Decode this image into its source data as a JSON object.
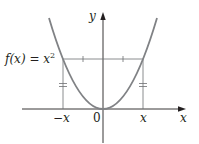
{
  "figure": {
    "function_label": "f(x) = x²",
    "function_label_base": "f(x) = x",
    "function_label_exp": "2",
    "y_axis_label": "y",
    "x_axis_label": "x",
    "tick_neg_x": "−x",
    "tick_origin": "0",
    "tick_pos_x": "x",
    "colors": {
      "curve": "#808285",
      "axes": "#231f20",
      "guides": "#6d6e71",
      "background": "#ffffff"
    }
  }
}
